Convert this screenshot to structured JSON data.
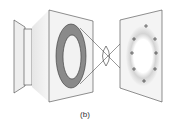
{
  "caption": "(b)",
  "diagram": {
    "type": "optics-annular-aperture",
    "elements": [
      {
        "id": "source-housing",
        "label": ""
      },
      {
        "id": "annular-aperture-plate",
        "label": ""
      },
      {
        "id": "lens",
        "label": ""
      },
      {
        "id": "image-plane",
        "label": ""
      }
    ],
    "image_markers": {
      "symbol": "+",
      "count": 10
    }
  },
  "colors": {
    "ring": "#8a8a8a",
    "outline": "#333333",
    "panel": "#efefef",
    "glow": "#d9d9d9"
  }
}
